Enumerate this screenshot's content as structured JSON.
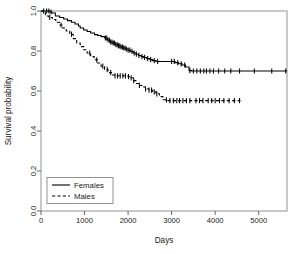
{
  "chart_data": {
    "type": "line",
    "title": "",
    "subtitle": "",
    "xlabel": "Days",
    "ylabel": "Survival probability",
    "xlim": [
      0,
      5650
    ],
    "ylim": [
      0.0,
      1.0
    ],
    "grid": false,
    "legend_position": "bottom-left",
    "xticks": [
      0,
      1000,
      2000,
      3000,
      4000,
      5000
    ],
    "xtick_labels": [
      "0",
      "1000",
      "2000",
      "3000",
      "4000",
      "5000"
    ],
    "yticks": [
      0.0,
      0.2,
      0.4,
      0.6,
      0.8,
      1.0
    ],
    "ytick_labels": [
      "0.0",
      "0.2",
      "0.4",
      "0.6",
      "0.8",
      "1.0"
    ],
    "series": [
      {
        "name": "Females",
        "linestyle": "solid",
        "color": "#000000",
        "x": [
          0,
          120,
          200,
          250,
          330,
          430,
          520,
          610,
          700,
          780,
          860,
          900,
          980,
          1060,
          1140,
          1230,
          1300,
          1380,
          1460,
          1520,
          1580,
          1640,
          1700,
          1760,
          1820,
          1880,
          1940,
          2000,
          2060,
          2120,
          2180,
          2240,
          2300,
          2360,
          2430,
          2500,
          2560,
          2640,
          2720,
          2800,
          2900,
          3000,
          3080,
          3160,
          3240,
          3320,
          3400,
          3460,
          3560,
          3700,
          3850,
          4000,
          4200,
          4400,
          4650,
          5000,
          5350,
          5650
        ],
        "y": [
          1.0,
          1.0,
          0.995,
          0.99,
          0.975,
          0.968,
          0.96,
          0.952,
          0.944,
          0.935,
          0.925,
          0.915,
          0.905,
          0.898,
          0.89,
          0.882,
          0.878,
          0.872,
          0.865,
          0.855,
          0.845,
          0.84,
          0.832,
          0.826,
          0.82,
          0.815,
          0.81,
          0.804,
          0.798,
          0.79,
          0.784,
          0.778,
          0.772,
          0.768,
          0.762,
          0.757,
          0.752,
          0.748,
          0.748,
          0.748,
          0.748,
          0.748,
          0.742,
          0.736,
          0.73,
          0.72,
          0.702,
          0.7,
          0.7,
          0.7,
          0.7,
          0.7,
          0.7,
          0.7,
          0.7,
          0.7,
          0.7,
          0.7
        ],
        "censor_x": [
          60,
          130,
          180,
          230,
          1480,
          1510,
          1540,
          1570,
          1600,
          1630,
          1660,
          1690,
          1720,
          1750,
          1780,
          1810,
          1840,
          1870,
          1900,
          1930,
          1960,
          2000,
          2040,
          2090,
          2140,
          2190,
          2250,
          2320,
          2380,
          2450,
          2520,
          2600,
          2680,
          3000,
          3060,
          3140,
          3220,
          3300,
          3420,
          3500,
          3580,
          3660,
          3740,
          3800,
          3880,
          3960,
          4080,
          4220,
          4360,
          4560,
          4900,
          5300,
          5620
        ],
        "final_survival": 0.7
      },
      {
        "name": "Males",
        "linestyle": "dashed",
        "color": "#000000",
        "x": [
          0,
          100,
          180,
          260,
          340,
          420,
          500,
          580,
          660,
          740,
          820,
          900,
          980,
          1060,
          1140,
          1220,
          1300,
          1380,
          1460,
          1540,
          1620,
          1700,
          1780,
          1860,
          1940,
          2000,
          2060,
          2120,
          2180,
          2240,
          2320,
          2400,
          2480,
          2560,
          2640,
          2720,
          2800,
          2900,
          3000,
          3200,
          3400,
          3600,
          3800,
          4000,
          4200,
          4400,
          4580
        ],
        "y": [
          1.0,
          0.975,
          0.968,
          0.958,
          0.944,
          0.93,
          0.915,
          0.9,
          0.884,
          0.862,
          0.84,
          0.822,
          0.806,
          0.79,
          0.772,
          0.756,
          0.74,
          0.724,
          0.708,
          0.692,
          0.68,
          0.676,
          0.676,
          0.676,
          0.676,
          0.672,
          0.666,
          0.652,
          0.638,
          0.628,
          0.62,
          0.61,
          0.604,
          0.596,
          0.586,
          0.572,
          0.556,
          0.552,
          0.552,
          0.552,
          0.552,
          0.552,
          0.552,
          0.552,
          0.552,
          0.552,
          0.552
        ],
        "censor_x": [
          200,
          460,
          700,
          1120,
          1280,
          1420,
          1520,
          1600,
          1700,
          1760,
          1820,
          1880,
          1940,
          2010,
          2070,
          2130,
          2260,
          2400,
          2480,
          2540,
          2600,
          2660,
          2880,
          2960,
          3040,
          3120,
          3180,
          3260,
          3340,
          3420,
          3560,
          3640,
          3720,
          3840,
          3920,
          4000,
          4100,
          4200,
          4320,
          4440,
          4560
        ],
        "final_survival": 0.552
      }
    ]
  },
  "axes": {
    "xlabel": "Days",
    "ylabel": "Survival probability"
  },
  "legend": {
    "items": [
      {
        "label": "Females",
        "style": "solid"
      },
      {
        "label": "Males",
        "style": "dashed"
      }
    ]
  },
  "colors": {
    "background": "#ffffff",
    "axis": "#555555",
    "series": "#000000",
    "text": "#202020"
  }
}
